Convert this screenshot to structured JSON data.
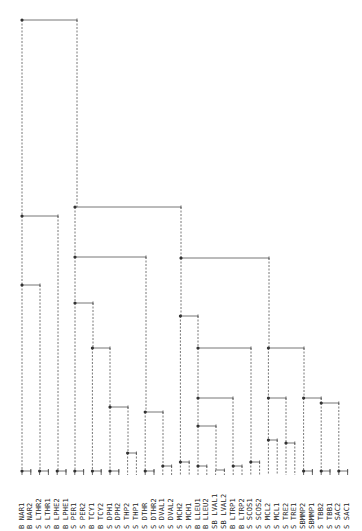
{
  "diagram": {
    "type": "dendrogram",
    "orientation": "root-top-left, leaves-bottom, labels rotated",
    "leaf_x0": 22,
    "leaf_dx": 8.8,
    "leaf_y": 471,
    "leaves": [
      "B NAR1",
      "B NAR2",
      "S LTHR2",
      "S LTHR1",
      "B LPHE2",
      "B LPHE1",
      "S PER1",
      "S PER2",
      "B TCY1",
      "B TCY2",
      "S DPH1",
      "S DPH2",
      "S THP2",
      "S THP1",
      "S DTHR",
      "S DTHR2",
      "S DVAL1",
      "S DVAL2",
      "S MCH2",
      "S MCH1",
      "B LLEU1",
      "B LLEU2",
      "SB LVAL1",
      "SB LVAL2",
      "B LTRP1",
      "B LTRP2",
      "S SCOS1",
      "S SCOS2",
      "S MCL2",
      "S MCL1",
      "S TRE2",
      "S TRE1",
      "SBMMP2",
      "SBMMP1",
      "S TBB2",
      "S TBB1",
      "S SAC2",
      "S SAC1"
    ],
    "nodes": [
      {
        "id": "root",
        "x": 22,
        "y": 20,
        "x2": 77,
        "left": "L1",
        "right": "R1"
      },
      {
        "id": "L1",
        "x": 22,
        "y": 216,
        "x2": 58,
        "left": "L2",
        "right": "LPHE"
      },
      {
        "id": "L2",
        "x": 22,
        "y": 285,
        "x2": 40,
        "left": "NAR",
        "right": "LTHR"
      },
      {
        "id": "NAR",
        "x": 22,
        "y": 471,
        "x2": 30.8,
        "leafs": [
          0,
          1
        ]
      },
      {
        "id": "LTHR",
        "x": 39.6,
        "y": 471,
        "x2": 48.4,
        "leafs": [
          2,
          3
        ]
      },
      {
        "id": "LPHE",
        "x": 57.2,
        "y": 471,
        "x2": 66,
        "leafs": [
          4,
          5
        ]
      },
      {
        "id": "R1",
        "x": 75,
        "y": 207,
        "x2": 181,
        "left": "R2",
        "right": "R3"
      },
      {
        "id": "R2",
        "x": 75,
        "y": 257,
        "x2": 146,
        "left": "R2a",
        "right": "R2b"
      },
      {
        "id": "R2a",
        "x": 75,
        "y": 303,
        "x2": 93,
        "left": "PER",
        "right": "R2a1"
      },
      {
        "id": "PER",
        "x": 74.8,
        "y": 471,
        "x2": 83.6,
        "leafs": [
          6,
          7
        ]
      },
      {
        "id": "R2a1",
        "x": 92.4,
        "y": 348,
        "x2": 110,
        "left": "TCY",
        "right": "R2a2"
      },
      {
        "id": "TCY",
        "x": 92.4,
        "y": 471,
        "x2": 101.2,
        "leafs": [
          8,
          9
        ]
      },
      {
        "id": "R2a2",
        "x": 110,
        "y": 407,
        "x2": 128,
        "left": "DPH",
        "right": "THP"
      },
      {
        "id": "DPH",
        "x": 110,
        "y": 471,
        "x2": 118.8,
        "leafs": [
          10,
          11
        ]
      },
      {
        "id": "THP",
        "x": 127.6,
        "y": 453,
        "x2": 136.4,
        "leafs": [
          12,
          13
        ]
      },
      {
        "id": "R2b",
        "x": 145.2,
        "y": 412,
        "x2": 163,
        "left": "DTHR",
        "right": "DVAL"
      },
      {
        "id": "DTHR",
        "x": 145.2,
        "y": 471,
        "x2": 154,
        "leafs": [
          14,
          15
        ]
      },
      {
        "id": "DVAL",
        "x": 162.8,
        "y": 466,
        "x2": 171.6,
        "leafs": [
          16,
          17
        ]
      },
      {
        "id": "R3",
        "x": 181,
        "y": 258,
        "x2": 269,
        "left": "R3a",
        "right": "R3b"
      },
      {
        "id": "R3a",
        "x": 180.4,
        "y": 316,
        "x2": 198,
        "left": "MCH",
        "right": "R3a1"
      },
      {
        "id": "MCH",
        "x": 180.4,
        "y": 462,
        "x2": 189.2,
        "leafs": [
          18,
          19
        ]
      },
      {
        "id": "R3a1",
        "x": 198,
        "y": 348,
        "x2": 251,
        "left": "R3a2",
        "right": "SCOS"
      },
      {
        "id": "R3a2",
        "x": 198,
        "y": 398,
        "x2": 233,
        "left": "R3a3",
        "right": "LTRP"
      },
      {
        "id": "R3a3",
        "x": 198,
        "y": 426,
        "x2": 216,
        "left": "LLEU",
        "right": "LVAL"
      },
      {
        "id": "LLEU",
        "x": 198,
        "y": 466,
        "x2": 206.8,
        "leafs": [
          20,
          21
        ]
      },
      {
        "id": "LVAL",
        "x": 215.6,
        "y": 470,
        "x2": 224.4,
        "leafs": [
          22,
          23
        ],
        "nodot": true
      },
      {
        "id": "LTRP",
        "x": 233.2,
        "y": 466,
        "x2": 242,
        "leafs": [
          24,
          25
        ]
      },
      {
        "id": "SCOS",
        "x": 250.8,
        "y": 462,
        "x2": 259.6,
        "leafs": [
          26,
          27
        ]
      },
      {
        "id": "R3b",
        "x": 268.4,
        "y": 348,
        "x2": 304,
        "left": "R3b1",
        "right": "R3b2"
      },
      {
        "id": "R3b1",
        "x": 268.4,
        "y": 398,
        "x2": 286,
        "left": "MCL",
        "right": "TRE"
      },
      {
        "id": "MCL",
        "x": 268.4,
        "y": 440,
        "x2": 277.2,
        "leafs": [
          28,
          29
        ]
      },
      {
        "id": "TRE",
        "x": 286,
        "y": 443,
        "x2": 294.8,
        "leafs": [
          30,
          31
        ]
      },
      {
        "id": "R3b2",
        "x": 303.6,
        "y": 398,
        "x2": 321.2,
        "left": "SBMMP",
        "right": "R3b3"
      },
      {
        "id": "SBMMP",
        "x": 303.6,
        "y": 471,
        "x2": 312.4,
        "leafs": [
          32,
          33
        ]
      },
      {
        "id": "R3b3",
        "x": 321.2,
        "y": 403,
        "x2": 338.8,
        "left": "TBB",
        "right": "SAC"
      },
      {
        "id": "TBB",
        "x": 321.2,
        "y": 471,
        "x2": 330,
        "leafs": [
          34,
          35
        ]
      },
      {
        "id": "SAC",
        "x": 338.8,
        "y": 471,
        "x2": 347.6,
        "leafs": [
          36,
          37
        ]
      }
    ]
  }
}
